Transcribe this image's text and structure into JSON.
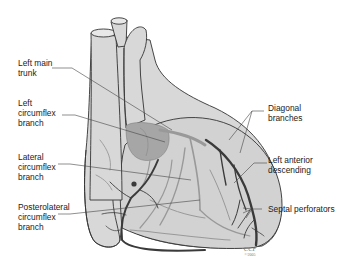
{
  "diagram": {
    "colors": {
      "heart_fill": "#d6d6d6",
      "heart_outline": "#333333",
      "artery_dark": "#3a3a3a",
      "artery_light": "#9a9a9a",
      "left_atrium": "#a8a8a8",
      "leader_line": "#444444",
      "label_text": "#222222"
    },
    "labels_left": [
      {
        "id": "left-main-trunk",
        "text": "Left main\ntrunk"
      },
      {
        "id": "left-circumflex-branch",
        "text": "Left\ncircumflex\nbranch"
      },
      {
        "id": "lateral-circumflex-branch",
        "text": "Lateral\ncircumflex\nbranch"
      },
      {
        "id": "posterolateral-circumflex-branch",
        "text": "Posterolateral\ncircumflex\nbranch"
      }
    ],
    "labels_right": [
      {
        "id": "diagonal-branches",
        "text": "Diagonal\nbranches"
      },
      {
        "id": "left-anterior-descending",
        "text": "Left anterior\ndescending"
      },
      {
        "id": "septal-perforators",
        "text": "Septal perforators"
      }
    ],
    "credit": {
      "org": "CCF",
      "year": "©2005"
    }
  }
}
